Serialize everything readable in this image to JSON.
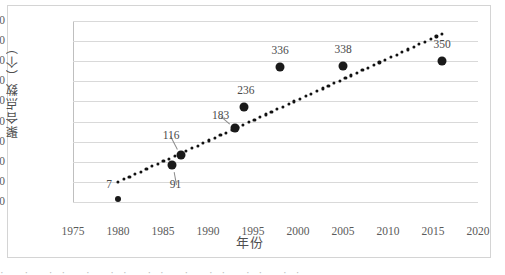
{
  "chart_data": {
    "type": "scatter",
    "title": "",
    "xlabel": "年份",
    "ylabel": "聚合点数（个）",
    "xlim": [
      1975,
      2020
    ],
    "ylim": [
      0,
      450
    ],
    "xticks": [
      1975,
      1980,
      1985,
      1990,
      1995,
      2000,
      2005,
      2010,
      2015,
      2020
    ],
    "yticks": [
      0,
      50,
      100,
      150,
      200,
      250,
      300,
      350,
      400,
      450
    ],
    "grid": true,
    "legend": "none",
    "series": [
      {
        "name": "聚合点数",
        "marker": "filled-circle",
        "color": "#1a1a1a",
        "x": [
          1980,
          1986,
          1987,
          1993,
          1994,
          1998,
          2005,
          2016
        ],
        "y": [
          7,
          91,
          116,
          183,
          236,
          336,
          338,
          350
        ],
        "labels": [
          "7",
          "91",
          "116",
          "183",
          "236",
          "336",
          "338",
          "350"
        ]
      },
      {
        "name": "线性趋势线",
        "type": "line",
        "style": "dotted",
        "color": "#111111",
        "x": [
          1980,
          2016
        ],
        "y": [
          50,
          418
        ]
      }
    ],
    "annotations": [
      {
        "text": "7",
        "anchor_x": 1980,
        "anchor_y": 7,
        "label_x": 1979.0,
        "label_y": 42,
        "leader": false
      },
      {
        "text": "91",
        "anchor_x": 1986,
        "anchor_y": 91,
        "label_x": 1986.4,
        "label_y": 42,
        "leader": true
      },
      {
        "text": "116",
        "anchor_x": 1987,
        "anchor_y": 116,
        "label_x": 1985.9,
        "label_y": 164,
        "leader": true
      },
      {
        "text": "183",
        "anchor_x": 1993,
        "anchor_y": 183,
        "label_x": 1991.4,
        "label_y": 214,
        "leader": true
      },
      {
        "text": "236",
        "anchor_x": 1994,
        "anchor_y": 236,
        "label_x": 1994.2,
        "label_y": 277,
        "leader": false
      },
      {
        "text": "336",
        "anchor_x": 1998,
        "anchor_y": 336,
        "label_x": 1998.0,
        "label_y": 376,
        "leader": false
      },
      {
        "text": "338",
        "anchor_x": 2005,
        "anchor_y": 338,
        "label_x": 2005.0,
        "label_y": 378,
        "leader": false
      },
      {
        "text": "350",
        "anchor_x": 2016,
        "anchor_y": 350,
        "label_x": 2016.0,
        "label_y": 390,
        "leader": false
      }
    ]
  },
  "caption_strip": "· · ·· · ·· ·· · ·· ·· ··"
}
